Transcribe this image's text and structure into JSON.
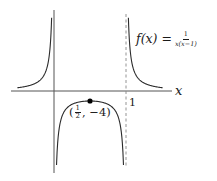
{
  "figure": {
    "function_label": {
      "lhs": "f(x) =",
      "numerator": "1",
      "denominator": "x(x−1)"
    },
    "x_axis_label": "x",
    "tick_label_one": "1",
    "point_label": {
      "open": "(",
      "numerator": "1",
      "denominator": "2",
      "rest": ", −4)"
    }
  },
  "chart_data": {
    "type": "line",
    "function": "1/(x*(x-1))",
    "xlabel": "x",
    "ylabel": "",
    "x_ticks": [
      1
    ],
    "vertical_asymptotes": [
      0,
      1
    ],
    "horizontal_asymptote": 0,
    "annotations": [
      {
        "x": 0.5,
        "y": -4,
        "label": "(1/2, −4)",
        "type": "local-maximum"
      }
    ],
    "branches": [
      {
        "name": "left",
        "x_range": [
          -0.51,
          -0.033
        ],
        "y_range": [
          1.28,
          29
        ]
      },
      {
        "name": "middle",
        "x_range": [
          0.035,
          0.965
        ],
        "y_range": [
          -29.6,
          -4
        ]
      },
      {
        "name": "right",
        "x_range": [
          1.033,
          1.51
        ],
        "y_range": [
          29,
          1.28
        ]
      }
    ],
    "pixel_mapping": {
      "origin_px": [
        54,
        91
      ],
      "x_px_per_unit": 72,
      "y_px_per_unit": 2.5
    },
    "colors": {
      "curve": "#2b2b2b",
      "axes": "#555555",
      "asymptote": "#888888",
      "point": "#000000"
    }
  }
}
